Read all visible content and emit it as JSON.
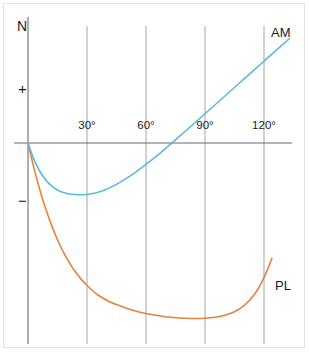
{
  "chart_data": {
    "type": "line",
    "title": "",
    "xlabel": "",
    "ylabel": "N",
    "grid": true,
    "legend_position": "inline-end-of-line",
    "xlim": [
      0,
      135
    ],
    "ylim": [
      -1.0,
      0.62
    ],
    "x_ticks": [
      "30°",
      "60°",
      "90°",
      "120°"
    ],
    "x_tick_values": [
      30,
      60,
      90,
      120
    ],
    "y_ticks": [
      "+",
      "−"
    ],
    "y_tick_values": [
      0.34,
      -0.38
    ],
    "zero_line": 0,
    "series": [
      {
        "name": "AM",
        "color": "#5cb9dc",
        "x": [
          0,
          3,
          6,
          9,
          12,
          15,
          18,
          21,
          24,
          27,
          30,
          33,
          36,
          39,
          42,
          45,
          50,
          55,
          60,
          65,
          70,
          75,
          80,
          85,
          90,
          95,
          100,
          105,
          110,
          115,
          120,
          125,
          130,
          133
        ],
        "y": [
          0.0,
          -0.082,
          -0.142,
          -0.186,
          -0.216,
          -0.236,
          -0.249,
          -0.256,
          -0.259,
          -0.26,
          -0.259,
          -0.254,
          -0.246,
          -0.236,
          -0.223,
          -0.208,
          -0.178,
          -0.145,
          -0.108,
          -0.069,
          -0.027,
          0.016,
          0.059,
          0.103,
          0.147,
          0.191,
          0.235,
          0.279,
          0.323,
          0.367,
          0.411,
          0.455,
          0.499,
          0.525
        ]
      },
      {
        "name": "PL",
        "color": "#e8813d",
        "x": [
          0,
          3,
          6,
          9,
          12,
          15,
          18,
          21,
          24,
          27,
          30,
          35,
          40,
          45,
          50,
          55,
          60,
          65,
          70,
          75,
          80,
          85,
          90,
          95,
          100,
          105,
          110,
          115,
          118,
          121,
          124
        ],
        "y": [
          0.0,
          -0.125,
          -0.235,
          -0.331,
          -0.414,
          -0.486,
          -0.548,
          -0.601,
          -0.646,
          -0.684,
          -0.716,
          -0.76,
          -0.79,
          -0.812,
          -0.83,
          -0.845,
          -0.857,
          -0.866,
          -0.873,
          -0.878,
          -0.881,
          -0.882,
          -0.881,
          -0.876,
          -0.866,
          -0.848,
          -0.816,
          -0.762,
          -0.715,
          -0.654,
          -0.58
        ]
      }
    ]
  },
  "axis": {
    "y_title": "N",
    "y_tick_positive": "+",
    "y_tick_negative": "−"
  },
  "labels": {
    "am": "AM",
    "pl": "PL"
  },
  "colors": {
    "am": "#5cb9dc",
    "pl": "#e8813d",
    "axis": "#6b6b6b",
    "grid": "#9a9a9a",
    "frame": "#e2e2e2",
    "text": "#1a1a1a"
  },
  "ticks": {
    "x": [
      {
        "label": "30°"
      },
      {
        "label": "60°"
      },
      {
        "label": "90°"
      },
      {
        "label": "120°"
      }
    ]
  }
}
